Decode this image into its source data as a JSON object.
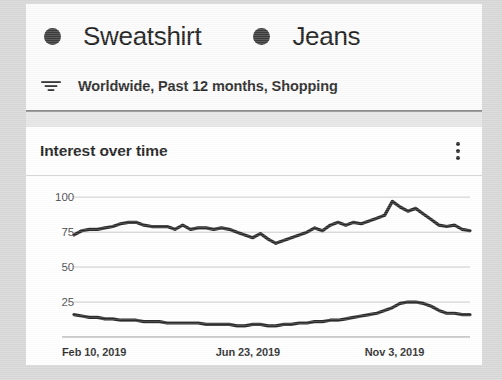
{
  "legend": {
    "items": [
      {
        "label": "Sweatshirt",
        "dot_color": "#3c3c3c",
        "name": "legend-sweatshirt"
      },
      {
        "label": "Jeans",
        "dot_color": "#3c3c3c",
        "name": "legend-jeans"
      }
    ]
  },
  "filter": {
    "icon": "filter-tune-icon",
    "text": "Worldwide, Past 12 months, Shopping"
  },
  "chart_card": {
    "title": "Interest over time",
    "menu_icon": "more-vertical-icon"
  },
  "colors": {
    "page_background": "#d8d8d8",
    "card_background": "#ffffff",
    "gridline": "#c8c8c8",
    "axis": "#9a9a9a",
    "series_line": "#2b2b2b",
    "text_primary": "#1b1b1b",
    "text_secondary": "#4a4a4a"
  },
  "chart_data": {
    "type": "line",
    "title": "Interest over time",
    "xlabel": "",
    "ylabel": "",
    "ylim": [
      0,
      108
    ],
    "yticks": [
      100,
      75,
      50,
      25
    ],
    "grid": true,
    "legend_position": "top",
    "x_tick_labels": [
      "Feb 10, 2019",
      "Jun 23, 2019",
      "Nov 3, 2019"
    ],
    "x_tick_positions": [
      0,
      0.377,
      0.742
    ],
    "x": [
      0,
      1,
      2,
      3,
      4,
      5,
      6,
      7,
      8,
      9,
      10,
      11,
      12,
      13,
      14,
      15,
      16,
      17,
      18,
      19,
      20,
      21,
      22,
      23,
      24,
      25,
      26,
      27,
      28,
      29,
      30,
      31,
      32,
      33,
      34,
      35,
      36,
      37,
      38,
      39,
      40,
      41,
      42,
      43,
      44,
      45,
      46,
      47,
      48,
      49,
      50,
      51
    ],
    "series": [
      {
        "name": "Sweatshirt",
        "color": "#2b2b2b",
        "values": [
          73,
          76,
          77,
          77,
          78,
          79,
          81,
          82,
          82,
          80,
          79,
          79,
          79,
          77,
          80,
          77,
          78,
          78,
          77,
          78,
          77,
          75,
          73,
          71,
          74,
          70,
          67,
          69,
          71,
          73,
          75,
          78,
          76,
          80,
          82,
          80,
          82,
          81,
          83,
          85,
          87,
          97,
          93,
          90,
          92,
          88,
          84,
          80,
          79,
          80,
          77,
          76
        ]
      },
      {
        "name": "Jeans",
        "color": "#2b2b2b",
        "values": [
          16,
          15,
          14,
          14,
          13,
          13,
          12,
          12,
          12,
          11,
          11,
          11,
          10,
          10,
          10,
          10,
          10,
          9,
          9,
          9,
          9,
          8,
          8,
          9,
          9,
          8,
          8,
          9,
          9,
          10,
          10,
          11,
          11,
          12,
          12,
          13,
          14,
          15,
          16,
          17,
          19,
          21,
          24,
          25,
          25,
          24,
          22,
          19,
          17,
          17,
          16,
          16
        ]
      }
    ]
  }
}
